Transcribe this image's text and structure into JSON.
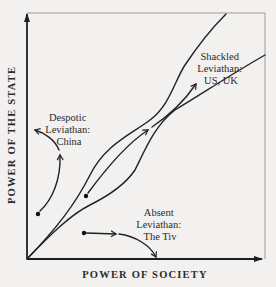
{
  "diagram": {
    "axes": {
      "x_label": "POWER OF SOCIETY",
      "y_label": "POWER OF THE STATE"
    },
    "regions": [
      {
        "id": "despotic",
        "lines": [
          "Despotic",
          "Leviathan:",
          "China"
        ]
      },
      {
        "id": "shackled",
        "lines": [
          "Shackled",
          "Leviathan:",
          "US, UK"
        ]
      },
      {
        "id": "absent",
        "lines": [
          "Absent",
          "Leviathan:",
          "The Tiv"
        ]
      }
    ],
    "colors": {
      "background": "#f2f1ef",
      "ink": "#222222",
      "frame": "#888888"
    }
  }
}
